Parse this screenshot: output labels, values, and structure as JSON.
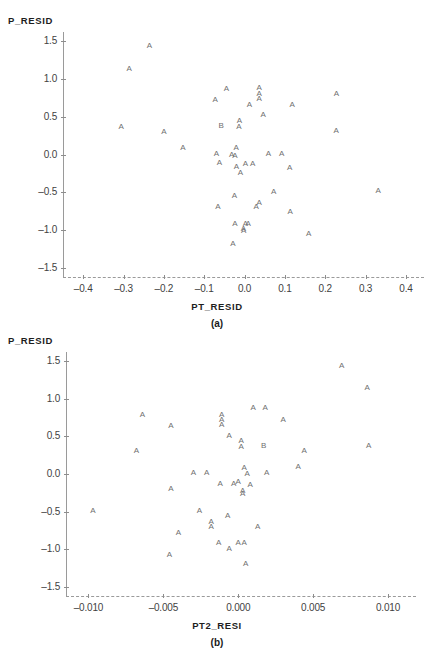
{
  "page": {
    "background": "#ffffff",
    "marker_color": "#6f6f6f",
    "axis_color": "#9a9a9a",
    "clipped_title": "",
    "caption_a": "(a)",
    "caption_b": "(b)"
  },
  "chart_data": [
    {
      "type": "scatter",
      "panel": "(a)",
      "title": "",
      "xlabel": "PT_RESID",
      "ylabel": "P_RESID",
      "xlim": [
        -0.45,
        0.42
      ],
      "ylim": [
        -1.62,
        1.62
      ],
      "xticks": [
        -0.4,
        -0.3,
        -0.2,
        -0.1,
        0.0,
        0.1,
        0.2,
        0.3,
        0.4
      ],
      "xticklabels": [
        "-0.4",
        "-0.3",
        "-0.2",
        "-0.1",
        "0.0",
        "0.1",
        "0.2",
        "0.3",
        "0.4"
      ],
      "yticks": [
        1.5,
        1.0,
        0.5,
        0.0,
        -0.5,
        -1.0,
        -1.5
      ],
      "yticklabels": [
        "1.5",
        "1.0",
        "0.5",
        "0.0",
        "-0.5",
        "-1.0",
        "-1.5"
      ],
      "grid": false,
      "legend": "none",
      "marker_labels": [
        "A",
        "B"
      ],
      "points": [
        {
          "x": -0.236,
          "y": 1.44,
          "label": "A"
        },
        {
          "x": -0.286,
          "y": 1.13,
          "label": "A"
        },
        {
          "x": -0.045,
          "y": 0.87,
          "label": "A"
        },
        {
          "x": 0.036,
          "y": 0.88,
          "label": "A"
        },
        {
          "x": 0.036,
          "y": 0.8,
          "label": "A"
        },
        {
          "x": 0.036,
          "y": 0.73,
          "label": "A"
        },
        {
          "x": -0.073,
          "y": 0.72,
          "label": "A"
        },
        {
          "x": 0.012,
          "y": 0.66,
          "label": "A"
        },
        {
          "x": 0.118,
          "y": 0.66,
          "label": "A"
        },
        {
          "x": 0.228,
          "y": 0.8,
          "label": "A"
        },
        {
          "x": 0.046,
          "y": 0.52,
          "label": "A"
        },
        {
          "x": -0.013,
          "y": 0.44,
          "label": "A"
        },
        {
          "x": -0.014,
          "y": 0.36,
          "label": "A"
        },
        {
          "x": -0.058,
          "y": 0.38,
          "label": "B"
        },
        {
          "x": -0.306,
          "y": 0.37,
          "label": "A"
        },
        {
          "x": -0.2,
          "y": 0.3,
          "label": "A"
        },
        {
          "x": 0.227,
          "y": 0.31,
          "label": "A"
        },
        {
          "x": -0.153,
          "y": 0.08,
          "label": "A"
        },
        {
          "x": -0.021,
          "y": 0.08,
          "label": "A"
        },
        {
          "x": -0.07,
          "y": 0.01,
          "label": "A"
        },
        {
          "x": -0.032,
          "y": 0.0,
          "label": "A"
        },
        {
          "x": -0.024,
          "y": -0.02,
          "label": "A"
        },
        {
          "x": 0.059,
          "y": 0.01,
          "label": "A"
        },
        {
          "x": 0.092,
          "y": 0.01,
          "label": "A"
        },
        {
          "x": -0.062,
          "y": -0.11,
          "label": "A"
        },
        {
          "x": -0.02,
          "y": -0.16,
          "label": "A"
        },
        {
          "x": 0.002,
          "y": -0.13,
          "label": "A"
        },
        {
          "x": 0.02,
          "y": -0.13,
          "label": "A"
        },
        {
          "x": 0.112,
          "y": -0.18,
          "label": "A"
        },
        {
          "x": -0.01,
          "y": -0.25,
          "label": "A"
        },
        {
          "x": 0.072,
          "y": -0.49,
          "label": "A"
        },
        {
          "x": 0.331,
          "y": -0.48,
          "label": "A"
        },
        {
          "x": -0.025,
          "y": -0.55,
          "label": "A"
        },
        {
          "x": 0.036,
          "y": -0.64,
          "label": "A"
        },
        {
          "x": 0.029,
          "y": -0.7,
          "label": "A"
        },
        {
          "x": -0.066,
          "y": -0.7,
          "label": "A"
        },
        {
          "x": 0.113,
          "y": -0.76,
          "label": "A"
        },
        {
          "x": -0.024,
          "y": -0.92,
          "label": "A"
        },
        {
          "x": 0.002,
          "y": -0.92,
          "label": "A"
        },
        {
          "x": 0.009,
          "y": -0.92,
          "label": "A"
        },
        {
          "x": -0.003,
          "y": -0.98,
          "label": "A"
        },
        {
          "x": -0.002,
          "y": -1.01,
          "label": "A"
        },
        {
          "x": 0.159,
          "y": -1.05,
          "label": "A"
        },
        {
          "x": -0.029,
          "y": -1.19,
          "label": "A"
        }
      ]
    },
    {
      "type": "scatter",
      "panel": "(b)",
      "title": "",
      "xlabel": "PT2_RESI",
      "ylabel": "P_RESID",
      "xlim": [
        -0.0115,
        0.0112
      ],
      "ylim": [
        -1.62,
        1.62
      ],
      "xticks": [
        -0.01,
        -0.005,
        0.0,
        0.005,
        0.01
      ],
      "xticklabels": [
        "-0.010",
        "-0.005",
        "0.000",
        "0.005",
        "0.010"
      ],
      "yticks": [
        1.5,
        1.0,
        0.5,
        0.0,
        -0.5,
        -1.0,
        -1.5
      ],
      "yticklabels": [
        "1.5",
        "1.0",
        "0.5",
        "0.0",
        "-0.5",
        "-1.0",
        "-1.5"
      ],
      "grid": false,
      "legend": "none",
      "marker_labels": [
        "A",
        "B"
      ],
      "points": [
        {
          "x": 0.0069,
          "y": 1.44,
          "label": "A"
        },
        {
          "x": 0.0086,
          "y": 1.14,
          "label": "A"
        },
        {
          "x": 0.001,
          "y": 0.87,
          "label": "A"
        },
        {
          "x": 0.0018,
          "y": 0.87,
          "label": "A"
        },
        {
          "x": -0.0011,
          "y": 0.79,
          "label": "A"
        },
        {
          "x": -0.0011,
          "y": 0.72,
          "label": "A"
        },
        {
          "x": -0.0011,
          "y": 0.65,
          "label": "A"
        },
        {
          "x": -0.0064,
          "y": 0.79,
          "label": "A"
        },
        {
          "x": -0.0045,
          "y": 0.64,
          "label": "A"
        },
        {
          "x": 0.003,
          "y": 0.72,
          "label": "A"
        },
        {
          "x": -0.0006,
          "y": 0.51,
          "label": "A"
        },
        {
          "x": 0.0002,
          "y": 0.44,
          "label": "A"
        },
        {
          "x": 0.0002,
          "y": 0.36,
          "label": "A"
        },
        {
          "x": 0.0017,
          "y": 0.37,
          "label": "B"
        },
        {
          "x": -0.0068,
          "y": 0.3,
          "label": "A"
        },
        {
          "x": 0.0044,
          "y": 0.31,
          "label": "A"
        },
        {
          "x": 0.0087,
          "y": 0.37,
          "label": "A"
        },
        {
          "x": 0.004,
          "y": 0.09,
          "label": "A"
        },
        {
          "x": 0.0004,
          "y": 0.08,
          "label": "A"
        },
        {
          "x": -0.003,
          "y": 0.01,
          "label": "A"
        },
        {
          "x": -0.0021,
          "y": 0.01,
          "label": "A"
        },
        {
          "x": 0.0006,
          "y": 0.0,
          "label": "A"
        },
        {
          "x": 0.0019,
          "y": 0.01,
          "label": "A"
        },
        {
          "x": -0.0012,
          "y": -0.13,
          "label": "A"
        },
        {
          "x": -0.0003,
          "y": -0.13,
          "label": "A"
        },
        {
          "x": 0.0,
          "y": -0.11,
          "label": "A"
        },
        {
          "x": 0.0008,
          "y": -0.14,
          "label": "A"
        },
        {
          "x": -0.0045,
          "y": -0.2,
          "label": "A"
        },
        {
          "x": 0.0003,
          "y": -0.22,
          "label": "A"
        },
        {
          "x": 0.0003,
          "y": -0.26,
          "label": "A"
        },
        {
          "x": -0.0097,
          "y": -0.49,
          "label": "A"
        },
        {
          "x": -0.0026,
          "y": -0.49,
          "label": "A"
        },
        {
          "x": -0.0007,
          "y": -0.56,
          "label": "A"
        },
        {
          "x": -0.0018,
          "y": -0.64,
          "label": "A"
        },
        {
          "x": -0.0018,
          "y": -0.7,
          "label": "A"
        },
        {
          "x": -0.004,
          "y": -0.78,
          "label": "A"
        },
        {
          "x": 0.0013,
          "y": -0.7,
          "label": "A"
        },
        {
          "x": -0.0013,
          "y": -0.92,
          "label": "A"
        },
        {
          "x": 0.0,
          "y": -0.92,
          "label": "A"
        },
        {
          "x": 0.0004,
          "y": -0.92,
          "label": "A"
        },
        {
          "x": -0.0006,
          "y": -0.99,
          "label": "A"
        },
        {
          "x": -0.0046,
          "y": -1.07,
          "label": "A"
        },
        {
          "x": 0.0005,
          "y": -1.19,
          "label": "A"
        }
      ]
    }
  ]
}
